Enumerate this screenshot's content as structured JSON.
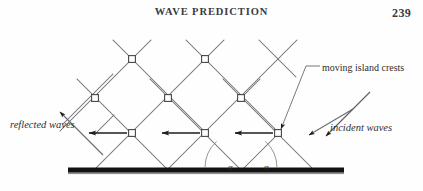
{
  "page": {
    "running_head": "WAVE PREDICTION",
    "folio": "239",
    "background_color": "#fefefe",
    "text_color": "#2f2f33"
  },
  "figure": {
    "name": "wave-crest-kinematics-diagram",
    "line_color": "#6a6a70",
    "node_fill": "#ffffff",
    "node_stroke": "#45454b",
    "arrow_color": "#1c1c1c",
    "seawall_color": "#121212",
    "labels": {
      "reflected_waves": "reflected waves",
      "incident_waves": "incident waves",
      "moving_island_crests": "moving island crests",
      "angle_left": "α",
      "angle_right": "α"
    },
    "geometry": {
      "baseline_y": 148,
      "baseline_x_start": 68,
      "baseline_x_end": 344,
      "node_rows": [
        {
          "y": 37,
          "x": [
            132,
            205
          ]
        },
        {
          "y": 76,
          "x": [
            95,
            168,
            241
          ]
        },
        {
          "y": 111,
          "x": [
            132,
            205,
            278
          ]
        }
      ],
      "horizontal_arrows": [
        {
          "y": 111,
          "from_x": 128,
          "to_x": 88
        },
        {
          "y": 111,
          "from_x": 201,
          "to_x": 161
        },
        {
          "y": 111,
          "from_x": 274,
          "to_x": 234
        }
      ],
      "angle_arcs": [
        {
          "vertex_x": 241,
          "radius": 36,
          "label": "α"
        },
        {
          "vertex_x": 241,
          "radius": 36,
          "label": "α"
        }
      ]
    }
  }
}
